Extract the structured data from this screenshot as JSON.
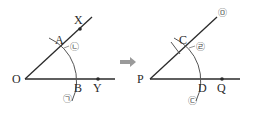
{
  "figure": {
    "colors": {
      "line": "#2a2a2a",
      "arc": "#555555",
      "arrow": "#9a9a9a",
      "marker": "#444444"
    },
    "left": {
      "points": {
        "O": "O",
        "A": "A",
        "B": "B",
        "X": "X",
        "Y": "Y"
      },
      "markers": {
        "m1": "㉠",
        "m2": "㉡"
      }
    },
    "arrow": "➡",
    "right": {
      "points": {
        "P": "P",
        "C": "C",
        "D": "D",
        "Q": "Q"
      },
      "markers": {
        "m3": "㉢",
        "m4": "㉣",
        "m5": "㉤"
      }
    }
  }
}
